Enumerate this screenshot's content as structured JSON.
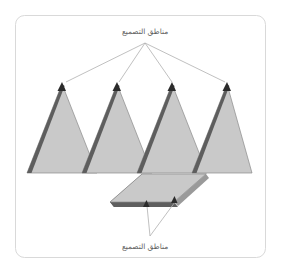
{
  "figure": {
    "title_top_label": "مناطق التصميع",
    "title_bottom_label": "مناطق التصميع",
    "frame": {
      "name": "figure-border",
      "stroke_color": "#d9d9d9",
      "fill_color": "#ffffff",
      "x": 15,
      "y": 15,
      "width": 251,
      "height": 243,
      "corner_radius": 9
    },
    "colors": {
      "shape_fill": "#c9c9c9",
      "shape_outline": "#8a8a8a",
      "forming_zone_edge": "#5e5e5e",
      "leader_line": "#b0b0b0",
      "marker": "#2b2b2b",
      "text": "#5d5d5d",
      "background": "#ffffff"
    },
    "peaks": [
      {
        "name": "peak-1",
        "apex_x": 62,
        "apex_y": 84,
        "base_left_x": 27,
        "base_right_x": 97,
        "base_y": 173
      },
      {
        "name": "peak-2",
        "apex_x": 117,
        "apex_y": 84,
        "base_left_x": 82,
        "base_right_x": 152,
        "base_y": 173
      },
      {
        "name": "peak-3",
        "apex_x": 172,
        "apex_y": 84,
        "base_left_x": 137,
        "base_right_x": 207,
        "base_y": 173
      },
      {
        "name": "peak-4",
        "apex_x": 227,
        "apex_y": 84,
        "base_left_x": 192,
        "base_right_x": 252,
        "base_y": 173
      }
    ],
    "slab": {
      "name": "flat-slab",
      "top_left_x": 142,
      "top_right_x": 206,
      "top_y": 174,
      "bottom_left_x": 110,
      "bottom_right_x": 174,
      "bottom_y": 202,
      "edge_thickness": 5
    },
    "top_leader": {
      "name": "top-leader-lines",
      "converge_x": 145,
      "converge_y": 43,
      "targets": [
        {
          "x": 64,
          "y": 83
        },
        {
          "x": 118,
          "y": 83
        },
        {
          "x": 172,
          "y": 83
        },
        {
          "x": 226,
          "y": 83
        }
      ]
    },
    "bottom_leader": {
      "name": "bottom-leader-lines",
      "converge_x": 150,
      "converge_y": 236,
      "targets": [
        {
          "x": 146,
          "y": 203
        },
        {
          "x": 174,
          "y": 199
        }
      ]
    },
    "top_label_pos": {
      "x": 145,
      "y": 34
    },
    "bottom_label_pos": {
      "x": 145,
      "y": 249
    }
  }
}
